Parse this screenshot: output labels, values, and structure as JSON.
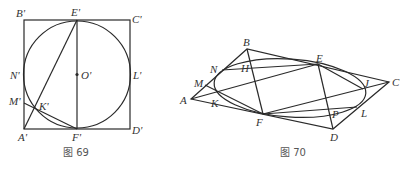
{
  "figure69": {
    "caption": "图 69",
    "labels": {
      "B": "B'",
      "E": "E'",
      "C": "C'",
      "N": "N'",
      "O": "O'",
      "L": "L'",
      "M": "M'",
      "K": "K'",
      "A": "A'",
      "F": "F'",
      "D": "D'"
    }
  },
  "figure70": {
    "caption": "图 70",
    "labels": {
      "B": "B",
      "H": "H",
      "E": "E",
      "N": "N",
      "M": "M",
      "J": "J",
      "C": "C",
      "A": "A",
      "K": "K",
      "P": "P",
      "L": "L",
      "F": "F",
      "D": "D"
    }
  },
  "colors": {
    "stroke": "#2a2a2a",
    "text": "#333333",
    "caption": "#555555"
  }
}
